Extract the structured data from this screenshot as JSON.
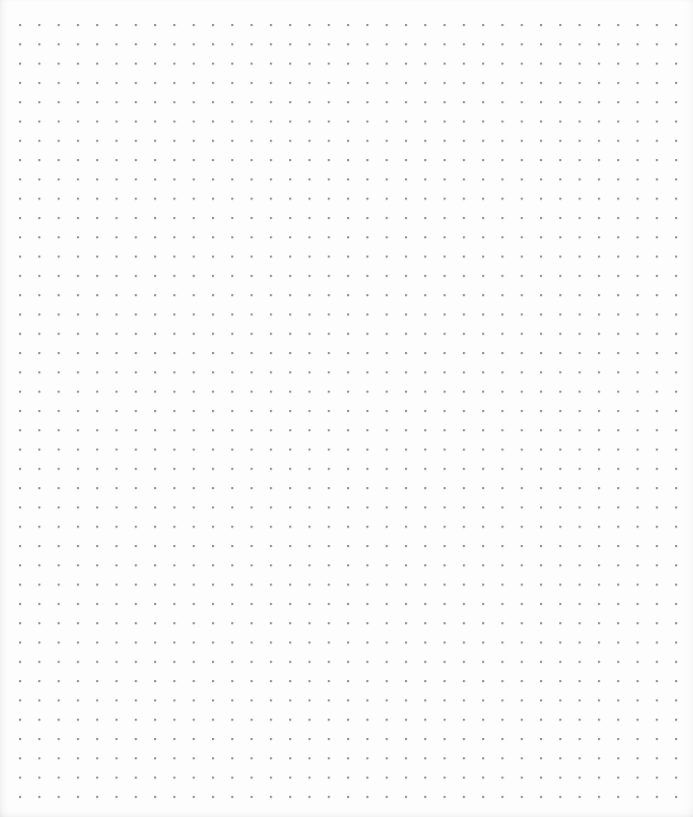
{
  "page": {
    "type": "dot-grid-paper",
    "background_color": "#fdfdfd",
    "dot_color": "#8f8f8f"
  },
  "grid": {
    "columns": 35,
    "rows": 41,
    "spacing_px": 19.3,
    "origin_x": 20,
    "origin_y": 25
  }
}
